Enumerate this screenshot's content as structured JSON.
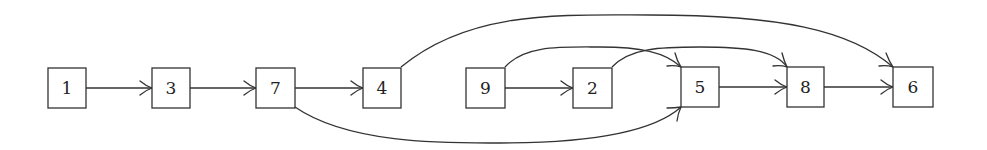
{
  "diagram": {
    "type": "directed-graph",
    "nodes": [
      {
        "id": "1",
        "label": "1",
        "x": 48,
        "y": 68,
        "w": 38,
        "h": 40
      },
      {
        "id": "3",
        "label": "3",
        "x": 152,
        "y": 68,
        "w": 38,
        "h": 40
      },
      {
        "id": "7",
        "label": "7",
        "x": 256,
        "y": 68,
        "w": 39,
        "h": 40
      },
      {
        "id": "4",
        "label": "4",
        "x": 363,
        "y": 68,
        "w": 38,
        "h": 40
      },
      {
        "id": "9",
        "label": "9",
        "x": 466,
        "y": 68,
        "w": 39,
        "h": 40
      },
      {
        "id": "2",
        "label": "2",
        "x": 573,
        "y": 68,
        "w": 39,
        "h": 40
      },
      {
        "id": "5",
        "label": "5",
        "x": 681,
        "y": 67,
        "w": 38,
        "h": 40
      },
      {
        "id": "8",
        "label": "8",
        "x": 787,
        "y": 67,
        "w": 37,
        "h": 40
      },
      {
        "id": "6",
        "label": "6",
        "x": 893,
        "y": 67,
        "w": 40,
        "h": 40
      }
    ],
    "edges": [
      {
        "from": "1",
        "to": "3",
        "style": "straight"
      },
      {
        "from": "3",
        "to": "7",
        "style": "straight"
      },
      {
        "from": "7",
        "to": "4",
        "style": "straight"
      },
      {
        "from": "9",
        "to": "2",
        "style": "straight"
      },
      {
        "from": "5",
        "to": "8",
        "style": "straight"
      },
      {
        "from": "8",
        "to": "6",
        "style": "straight"
      },
      {
        "from": "4",
        "to": "6",
        "style": "curve-over"
      },
      {
        "from": "9",
        "to": "5",
        "style": "curve-over"
      },
      {
        "from": "2",
        "to": "8",
        "style": "curve-over"
      },
      {
        "from": "7",
        "to": "5",
        "style": "curve-under"
      },
      {
        "from": "5",
        "to": "8",
        "style": "curve-over-short",
        "note": "incoming arrow at top of 8 from 2"
      }
    ]
  }
}
